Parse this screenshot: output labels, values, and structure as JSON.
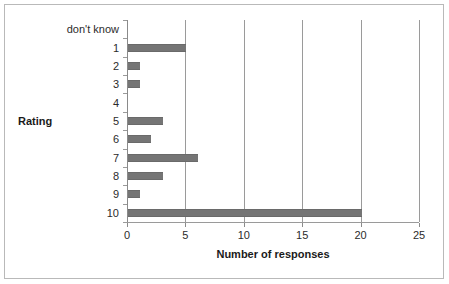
{
  "chart_data": {
    "type": "bar",
    "orientation": "horizontal",
    "title": "",
    "xlabel": "Number of responses",
    "ylabel": "Rating",
    "categories": [
      "don't know",
      "1",
      "2",
      "3",
      "4",
      "5",
      "6",
      "7",
      "8",
      "9",
      "10"
    ],
    "values": [
      0,
      5,
      1,
      1,
      0,
      3,
      2,
      6,
      3,
      1,
      20
    ],
    "xlim": [
      0,
      25
    ],
    "xticks": [
      0,
      5,
      10,
      15,
      20,
      25
    ],
    "xtick_labels": [
      "0",
      "5",
      "10",
      "15",
      "20",
      "25"
    ],
    "grid": "vertical",
    "legend": "none",
    "bar_color": "#757575",
    "series": [
      {
        "name": "Number of responses",
        "values": [
          0,
          5,
          1,
          1,
          0,
          3,
          2,
          6,
          3,
          1,
          20
        ]
      }
    ]
  },
  "frame": {
    "border_color": "#b9b9b9",
    "background": "#ffffff"
  }
}
